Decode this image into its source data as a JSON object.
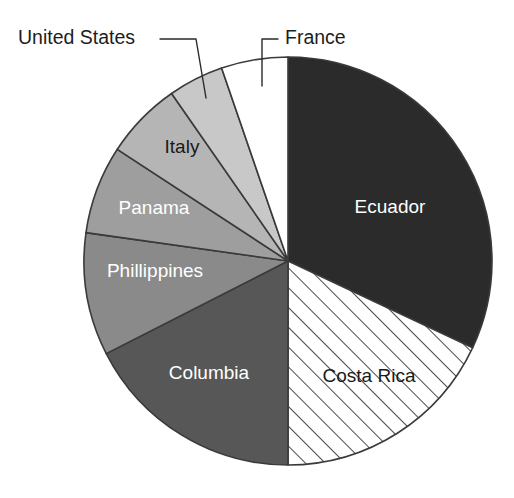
{
  "chart_data": {
    "type": "pie",
    "title": "",
    "subtitle": "",
    "xlabel": "",
    "ylabel": "",
    "legend_position": "none",
    "grid": false,
    "start_angle_deg": 0,
    "direction": "clockwise",
    "categories": [
      "Ecuador",
      "Costa Rica",
      "Columbia",
      "Phillippines",
      "Panama",
      "Italy",
      "United States",
      "France"
    ],
    "values": [
      32.0,
      18.0,
      17.5,
      9.7,
      7.0,
      6.1,
      4.4,
      5.3
    ],
    "units": "percent",
    "slices": [
      {
        "name": "Ecuador",
        "label": "Ecuador",
        "value": 32.0,
        "start_deg": 0,
        "end_deg": 115.2,
        "fill": "#2b2b2b",
        "pattern": "solid",
        "label_placement": "inside",
        "label_color": "#ffffff",
        "label_x": 390,
        "label_y": 208
      },
      {
        "name": "Costa Rica",
        "label": "Costa Rica",
        "value": 18.0,
        "start_deg": 115.2,
        "end_deg": 180.0,
        "fill": "#ffffff",
        "pattern": "diagonal-hatch",
        "label_placement": "inside",
        "label_color": "#1a1a1a",
        "label_x": 369,
        "label_y": 377
      },
      {
        "name": "Columbia",
        "label": "Columbia",
        "value": 17.5,
        "start_deg": 180.0,
        "end_deg": 243.0,
        "fill": "#575757",
        "pattern": "solid",
        "label_placement": "inside",
        "label_color": "#ffffff",
        "label_x": 209,
        "label_y": 374
      },
      {
        "name": "Phillippines",
        "label": "Phillippines",
        "value": 9.7,
        "start_deg": 243.0,
        "end_deg": 278.0,
        "fill": "#8a8a8a",
        "pattern": "solid",
        "label_placement": "inside",
        "label_color": "#ffffff",
        "label_x": 155,
        "label_y": 272
      },
      {
        "name": "Panama",
        "label": "Panama",
        "value": 7.0,
        "start_deg": 278.0,
        "end_deg": 303.2,
        "fill": "#9e9e9e",
        "pattern": "solid",
        "label_placement": "inside",
        "label_color": "#ffffff",
        "label_x": 154,
        "label_y": 209
      },
      {
        "name": "Italy",
        "label": "Italy",
        "value": 6.1,
        "start_deg": 303.2,
        "end_deg": 325.2,
        "fill": "#b5b5b5",
        "pattern": "solid",
        "label_placement": "inside",
        "label_color": "#1a1a1a",
        "label_x": 182,
        "label_y": 148
      },
      {
        "name": "United States",
        "label": "United States",
        "value": 4.4,
        "start_deg": 325.2,
        "end_deg": 341.0,
        "fill": "#c8c8c8",
        "pattern": "solid",
        "label_placement": "callout",
        "label_color": "#1d1d1d",
        "label_x": 18,
        "label_y": 39
      },
      {
        "name": "France",
        "label": "France",
        "value": 5.3,
        "start_deg": 341.0,
        "end_deg": 360.0,
        "fill": "#ffffff",
        "pattern": "solid",
        "label_placement": "callout",
        "label_color": "#1d1d1d",
        "label_x": 285,
        "label_y": 39
      }
    ],
    "callouts": [
      {
        "name": "united-states",
        "label": "United States",
        "text_x": 18,
        "text_y": 39,
        "anchor": "start",
        "path": "M 160 39 L 196 39 L 206 98"
      },
      {
        "name": "france",
        "label": "France",
        "text_x": 285,
        "text_y": 39,
        "anchor": "start",
        "path": "M 278 39 L 262 39 L 262 86"
      }
    ],
    "geometry": {
      "center_x": 288,
      "center_y": 261,
      "radius": 204
    }
  }
}
